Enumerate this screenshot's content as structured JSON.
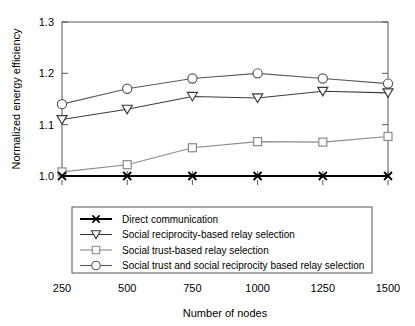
{
  "chart_data": {
    "type": "line",
    "title": "",
    "xlabel": "Number of nodes",
    "ylabel": "Normalized energy efficiency",
    "x": [
      250,
      500,
      750,
      1000,
      1250,
      1500
    ],
    "xticklabels": [
      "250",
      "500",
      "750",
      "1000",
      "1250",
      "1500"
    ],
    "yticklabels": [
      "1.0",
      "1.1",
      "1.2",
      "1.3"
    ],
    "yticks": [
      1.0,
      1.1,
      1.2,
      1.3
    ],
    "xlim": [
      250,
      1500
    ],
    "ylim": [
      1.0,
      1.3
    ],
    "grid": false,
    "legend_position": "lower center",
    "series": [
      {
        "name": "Direct communication",
        "marker": "x-marker",
        "color": "#000000",
        "values": [
          1.0,
          1.0,
          1.0,
          1.0,
          1.0,
          1.0
        ]
      },
      {
        "name": "Social reciprocity-based relay selection",
        "marker": "triangle-down-marker",
        "color": "#3b3b3b",
        "values": [
          1.11,
          1.13,
          1.155,
          1.152,
          1.165,
          1.162
        ]
      },
      {
        "name": "Social trust-based relay selection",
        "marker": "square-marker",
        "color": "#8a8a8a",
        "values": [
          1.008,
          1.022,
          1.055,
          1.067,
          1.066,
          1.077
        ]
      },
      {
        "name": "Social trust and social reciprocity based relay selection",
        "marker": "circle-marker",
        "color": "#5a5a5a",
        "values": [
          1.14,
          1.17,
          1.19,
          1.2,
          1.19,
          1.18
        ]
      }
    ]
  },
  "legend": {
    "entries": [
      "Direct communication",
      "Social reciprocity-based relay selection",
      "Social trust-based relay selection",
      "Social trust and social reciprocity based relay selection"
    ]
  }
}
